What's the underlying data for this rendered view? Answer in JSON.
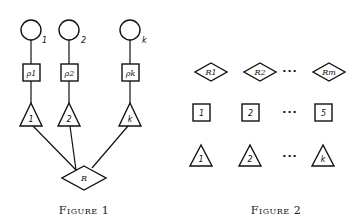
{
  "figure1": {
    "caption": "Figure 1",
    "columns": [
      {
        "circle_label": "1",
        "square_label": "ρ1",
        "triangle_label": "1"
      },
      {
        "circle_label": "2",
        "square_label": "ρ2",
        "triangle_label": "2"
      },
      {
        "circle_label": "k",
        "square_label": "ρk",
        "triangle_label": "k"
      }
    ],
    "diamond_label": "R"
  },
  "figure2": {
    "caption": "Figure 2",
    "diamonds": [
      "R1",
      "R2",
      "Rm"
    ],
    "squares": [
      "1",
      "2",
      "5"
    ],
    "triangles": [
      "1",
      "2",
      "k"
    ],
    "ellipsis": "···"
  }
}
